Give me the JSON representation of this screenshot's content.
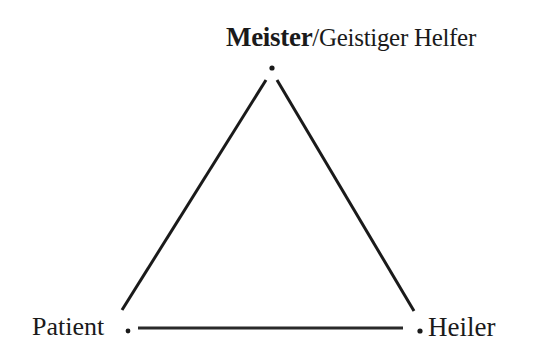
{
  "diagram": {
    "type": "triangle",
    "nodes": [
      {
        "id": "top",
        "label_primary": "Meister",
        "label_separator": "/",
        "label_secondary": "Geistiger Helfer"
      },
      {
        "id": "left",
        "label": "Patient"
      },
      {
        "id": "right",
        "label": "Heiler"
      }
    ],
    "edges": [
      {
        "from": "top",
        "to": "left"
      },
      {
        "from": "top",
        "to": "right"
      },
      {
        "from": "left",
        "to": "right"
      }
    ],
    "colors": {
      "line": "#1a1a1a",
      "background": "#ffffff"
    }
  }
}
